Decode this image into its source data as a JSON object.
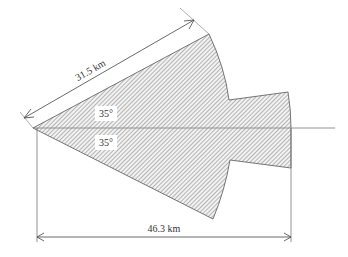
{
  "diagram": {
    "type": "sector-coverage-diagram",
    "dimensions": {
      "slant_range_label": "31.5 km",
      "horizontal_range_label": "46.3 km"
    },
    "angles": {
      "upper_label": "35°",
      "lower_label": "35°"
    },
    "colors": {
      "line": "#555555",
      "hatch": "#888888",
      "label_box": "#ffffff",
      "text": "#333333"
    }
  }
}
